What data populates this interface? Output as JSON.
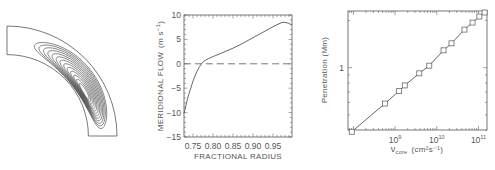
{
  "figure": {
    "panels": [
      "meridional-circulation-diagram",
      "meridional-flow-profile",
      "penetration-vs-viscosity"
    ]
  },
  "chart_data": [
    {
      "type": "diagram",
      "name": "meridional-circulation-quadrant",
      "description": "Streamlines of a single meridional circulation cell in one quadrant of a spherical shell; streamlines crowd toward the inner boundary",
      "inner_radius_fraction": 0.74,
      "contour_count": 13
    },
    {
      "type": "line",
      "title": "",
      "xlabel": "FRACTIONAL RADIUS",
      "ylabel": "MERIDIONAL FLOW",
      "ylabel_unit_base": "(m s",
      "ylabel_unit_exp": "−1",
      "ylabel_unit_close": ")",
      "xlim": [
        0.7275,
        0.9975
      ],
      "ylim": [
        -15,
        10
      ],
      "xticks": [
        0.75,
        0.8,
        0.85,
        0.9,
        0.95
      ],
      "xtick_labels": [
        "0.75",
        "0.80",
        "0.85",
        "0.90",
        "0.95"
      ],
      "yticks": [
        10,
        5,
        0,
        -5,
        -10,
        -15
      ],
      "ytick_labels": [
        "10",
        "5",
        "0",
        "−5",
        "−10",
        "−15"
      ],
      "grid": false,
      "series": [
        {
          "name": "meridional flow",
          "style": "solid",
          "x": [
            0.7275,
            0.732,
            0.737,
            0.742,
            0.747,
            0.752,
            0.757,
            0.762,
            0.767,
            0.772,
            0.777,
            0.785,
            0.795,
            0.81,
            0.83,
            0.85,
            0.87,
            0.89,
            0.91,
            0.93,
            0.95,
            0.965,
            0.975,
            0.985,
            0.9975
          ],
          "y": [
            -10.2,
            -8.6,
            -7.0,
            -5.6,
            -4.3,
            -3.1,
            -2.1,
            -1.2,
            -0.5,
            0.1,
            0.5,
            0.9,
            1.3,
            1.8,
            2.5,
            3.2,
            4.0,
            4.9,
            5.8,
            6.7,
            7.6,
            8.2,
            8.5,
            8.4,
            8.0
          ]
        },
        {
          "name": "zero line",
          "style": "dashed",
          "x": [
            0.7275,
            0.9975
          ],
          "y": [
            0,
            0
          ]
        }
      ]
    },
    {
      "type": "scatter",
      "title": "",
      "xlabel_symbol": "ν",
      "xlabel_subscript": "core",
      "xlabel_unit": "(cm²s⁻¹)",
      "ylabel": "Penetration (Mm)",
      "xscale": "log",
      "yscale": "log",
      "xlim": [
        74000000.0,
        160000000000.0
      ],
      "ylim": [
        0.4,
        2.3
      ],
      "xticks": [
        1000000000.0,
        10000000000.0,
        100000000000.0
      ],
      "xtick_labels": [
        {
          "base": "10",
          "exp": "9"
        },
        {
          "base": "10",
          "exp": "10"
        },
        {
          "base": "10",
          "exp": "11"
        }
      ],
      "yticks": [
        1
      ],
      "ytick_labels": [
        "1"
      ],
      "grid": false,
      "marker": "square",
      "connected": true,
      "series": [
        {
          "name": "penetration depth",
          "x": [
            91000000.0,
            570000000.0,
            1250000000.0,
            1700000000.0,
            3800000000.0,
            6600000000.0,
            14500000000.0,
            22500000000.0,
            46000000000.0,
            72000000000.0,
            105000000000.0,
            140000000000.0
          ],
          "y": [
            0.39,
            0.59,
            0.71,
            0.77,
            0.92,
            1.03,
            1.29,
            1.43,
            1.75,
            1.94,
            2.12,
            2.25
          ]
        }
      ]
    }
  ]
}
